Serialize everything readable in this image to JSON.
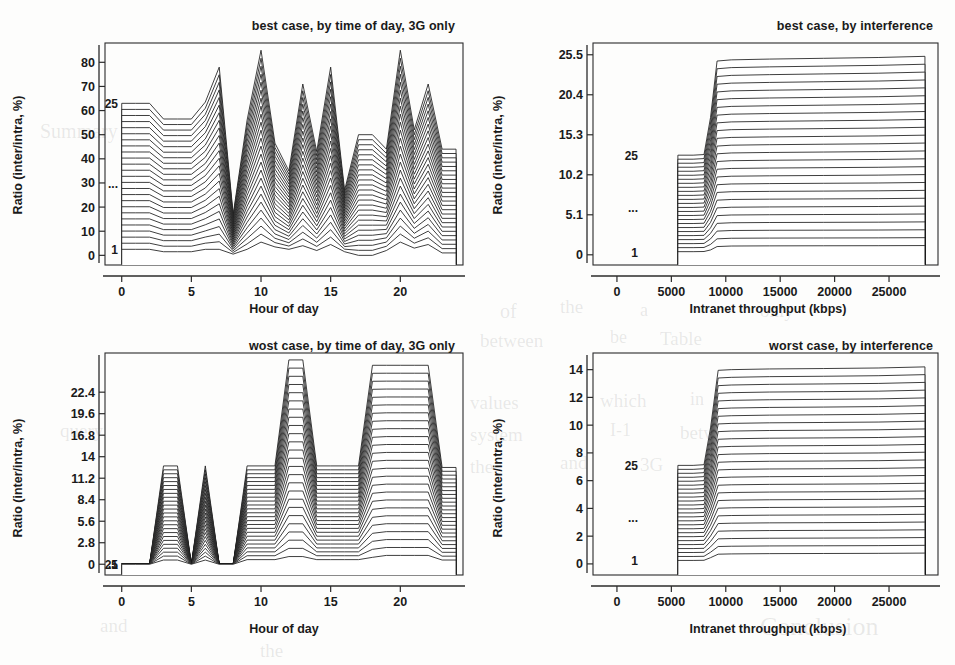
{
  "figure": {
    "kind": "ridgeline-grid",
    "rows": 2,
    "cols": 2,
    "ridge_first_label": "1",
    "ridge_last_label": "25",
    "ridge_ellipsis": "...",
    "ridge_count": 25
  },
  "bleed_text": [
    {
      "t": "of",
      "x": 500,
      "y": 300,
      "s": 20
    },
    {
      "t": "the",
      "x": 560,
      "y": 296,
      "s": 19
    },
    {
      "t": "a",
      "x": 640,
      "y": 300,
      "s": 18
    },
    {
      "t": "only",
      "x": 760,
      "y": 300,
      "s": 19
    },
    {
      "t": "between",
      "x": 480,
      "y": 330,
      "s": 19
    },
    {
      "t": "be",
      "x": 610,
      "y": 327,
      "s": 18
    },
    {
      "t": "Table",
      "x": 660,
      "y": 328,
      "s": 19
    },
    {
      "t": "values",
      "x": 470,
      "y": 392,
      "s": 19
    },
    {
      "t": "which",
      "x": 600,
      "y": 390,
      "s": 19
    },
    {
      "t": "in",
      "x": 690,
      "y": 389,
      "s": 18
    },
    {
      "t": "both",
      "x": 730,
      "y": 390,
      "s": 19
    },
    {
      "t": "system",
      "x": 470,
      "y": 424,
      "s": 19
    },
    {
      "t": "I-1",
      "x": 610,
      "y": 420,
      "s": 18
    },
    {
      "t": "between",
      "x": 680,
      "y": 422,
      "s": 19
    },
    {
      "t": "the",
      "x": 470,
      "y": 456,
      "s": 19
    },
    {
      "t": "and",
      "x": 560,
      "y": 452,
      "s": 19
    },
    {
      "t": "3G",
      "x": 640,
      "y": 454,
      "s": 19
    },
    {
      "t": "Conclusion",
      "x": 760,
      "y": 612,
      "s": 26
    },
    {
      "t": "Summary",
      "x": 40,
      "y": 120,
      "s": 20
    },
    {
      "t": "query",
      "x": 60,
      "y": 420,
      "s": 19
    },
    {
      "t": "and",
      "x": 100,
      "y": 615,
      "s": 19
    },
    {
      "t": "the",
      "x": 260,
      "y": 640,
      "s": 19
    }
  ],
  "chart_data": [
    {
      "id": "best-case-time-of-day",
      "type": "line",
      "title": "best case, by time of day, 3G only",
      "xlabel": "Hour of day",
      "ylabel": "Ratio (inter/intra, %)",
      "xlim": [
        -1.2,
        24.5
      ],
      "ylim": [
        -4,
        88
      ],
      "xticks": [
        0,
        5,
        10,
        15,
        20
      ],
      "yticks": [
        0,
        10,
        20,
        30,
        40,
        50,
        60,
        70,
        80
      ],
      "grid": false,
      "legend": "none",
      "ridges": 25,
      "ridge_offset_step": 2.5,
      "ridge_labels": {
        "first": "1",
        "last": "25",
        "middle": "..."
      },
      "x": [
        0,
        1,
        2,
        3,
        4,
        5,
        6,
        7,
        8,
        9,
        10,
        11,
        12,
        13,
        14,
        15,
        16,
        17,
        18,
        19,
        20,
        21,
        22,
        23,
        24
      ],
      "base_values": [
        2.5,
        2.5,
        2.5,
        1.5,
        1.5,
        1.5,
        2.5,
        2.5,
        0.5,
        2.5,
        5.5,
        3.5,
        2.5,
        4.0,
        2.0,
        4.5,
        1.5,
        0.0,
        0.0,
        2.0,
        5.5,
        3.0,
        4.5,
        1.0,
        1.0
      ],
      "top_values": [
        63.0,
        63.0,
        63.0,
        56.5,
        56.5,
        56.5,
        63.5,
        78.0,
        17.0,
        56.0,
        85.0,
        46.5,
        35.0,
        71.0,
        43.0,
        78.0,
        27.0,
        50.0,
        50.0,
        44.0,
        85.0,
        52.0,
        71.0,
        44.0,
        44.0
      ],
      "notes": "25 stacked ridgeline curves; curve i is the baseline shape scaled from base_values (i=1) to top_values (i=25)."
    },
    {
      "id": "best-case-interference",
      "type": "line",
      "title": "best case, by interference",
      "xlabel": "Intranet throughput (kbps)",
      "ylabel": "Ratio (inter/intra, %)",
      "xlim": [
        -2200,
        29500
      ],
      "ylim": [
        -1.3,
        27.0
      ],
      "xticks": [
        0,
        5000,
        10000,
        15000,
        20000,
        25000
      ],
      "yticks": [
        0,
        5.1,
        10.2,
        15.3,
        20.4,
        25.5
      ],
      "grid": false,
      "legend": "none",
      "ridges": 25,
      "ridge_labels": {
        "first": "1",
        "last": "25",
        "middle": "..."
      },
      "x": [
        5600,
        7000,
        8000,
        8600,
        9200,
        10500,
        14000,
        19000,
        24000,
        28300
      ],
      "base_values": [
        0.4,
        0.4,
        0.42,
        0.62,
        1.05,
        1.12,
        1.14,
        1.15,
        1.16,
        1.18
      ],
      "top_values": [
        12.7,
        12.7,
        12.78,
        17.5,
        24.7,
        24.85,
        24.95,
        25.05,
        25.15,
        25.3
      ],
      "notes": "Step-up ridgeline: flat low plateau to ~8000 kbps, sharp rise, then flat high plateau."
    },
    {
      "id": "worst-case-time-of-day",
      "type": "line",
      "title": "wost case, by time of day, 3G only",
      "xlabel": "Hour of day",
      "ylabel": "Ratio (inter/intra, %)",
      "xlim": [
        -1.2,
        24.5
      ],
      "ylim": [
        -1.4,
        27.5
      ],
      "xticks": [
        0,
        5,
        10,
        15,
        20
      ],
      "yticks": [
        0,
        2.8,
        5.6,
        8.4,
        11.2,
        14,
        16.8,
        19.6,
        22.4
      ],
      "grid": false,
      "legend": "none",
      "ridges": 25,
      "ridge_labels": {
        "first": "1",
        "last": "25",
        "middle": "..."
      },
      "x": [
        0,
        1,
        2,
        3,
        4,
        5,
        6,
        7,
        8,
        9,
        10,
        11,
        12,
        13,
        14,
        15,
        16,
        17,
        18,
        19,
        20,
        21,
        22,
        23,
        24
      ],
      "base_values": [
        0.0,
        0.0,
        0.0,
        0.55,
        0.55,
        0.0,
        0.55,
        0.0,
        0.0,
        0.6,
        0.6,
        0.6,
        1.0,
        1.0,
        0.6,
        0.6,
        0.6,
        0.6,
        0.9,
        1.15,
        1.15,
        1.15,
        1.15,
        0.55,
        0.55
      ],
      "top_values": [
        0.0,
        0.0,
        0.0,
        12.8,
        12.8,
        0.0,
        12.8,
        0.0,
        0.0,
        12.8,
        12.8,
        12.8,
        26.6,
        26.6,
        12.8,
        12.8,
        12.8,
        12.8,
        25.9,
        25.9,
        25.9,
        25.9,
        25.9,
        12.6,
        12.6
      ],
      "notes": "Plateau/trapezoid ridgeline with three tall blocks and two narrow spikes."
    },
    {
      "id": "worst-case-interference",
      "type": "line",
      "title": "worst case, by interference",
      "xlabel": "Intranet throughput (kbps)",
      "ylabel": "Ratio (inter/intra, %)",
      "xlim": [
        -2200,
        29500
      ],
      "ylim": [
        -0.8,
        15.2
      ],
      "xticks": [
        0,
        5000,
        10000,
        15000,
        20000,
        25000
      ],
      "yticks": [
        0,
        2,
        4,
        6,
        8,
        10,
        12,
        14
      ],
      "grid": false,
      "legend": "none",
      "ridges": 25,
      "ridge_labels": {
        "first": "1",
        "last": "25",
        "middle": "..."
      },
      "x": [
        5600,
        7000,
        8000,
        8600,
        9300,
        10500,
        14000,
        19000,
        24000,
        28300
      ],
      "base_values": [
        0.25,
        0.25,
        0.26,
        0.45,
        0.7,
        0.72,
        0.74,
        0.75,
        0.76,
        0.78
      ],
      "top_values": [
        7.1,
        7.1,
        7.15,
        9.8,
        13.95,
        14.0,
        14.05,
        14.08,
        14.12,
        14.2
      ],
      "notes": "Step-up ridgeline: flat low plateau to ~8000 kbps, sharp rise, then flat high plateau."
    }
  ]
}
